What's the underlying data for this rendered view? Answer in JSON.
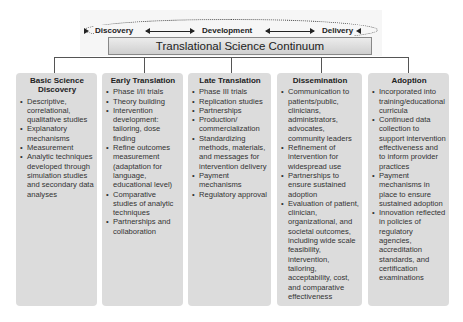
{
  "header": {
    "phases": [
      "Discovery",
      "Development",
      "Delivery"
    ],
    "continuum_label": "Translational Science Continuum"
  },
  "stages": [
    {
      "title": "Basic Science Discovery",
      "items": [
        "Descriptive, correlational, qualitative studies",
        "Explanatory mechanisms",
        "Measurement",
        "Analytic techniques developed through simulation studies and secondary data analyses"
      ]
    },
    {
      "title": "Early Translation",
      "items": [
        "Phase I/II trials",
        "Theory building",
        "Intervention development: tailoring, dose finding",
        "Refine outcomes measurement (adaptation for language, educational level)",
        "Comparative studies of analytic techniques",
        "Partnerships and collaboration"
      ]
    },
    {
      "title": "Late Translation",
      "items": [
        "Phase III trials",
        "Replication studies",
        "Partnerships",
        "Production/ commercialization",
        "Standardizing methods, materials, and messages for intervention delivery",
        "Payment mechanisms",
        "Regulatory approval"
      ]
    },
    {
      "title": "Dissemination",
      "items": [
        "Communication to patients/public, clinicians, administrators, advocates, community leaders",
        "Refinement of intervention for widespread use",
        "Partnerships to ensure sustained adoption",
        "Evaluation of patient, clinician, organizational, and societal outcomes, including wide scale feasibility, intervention, tailoring, acceptability, cost, and comparative effectiveness"
      ]
    },
    {
      "title": "Adoption",
      "items": [
        "Incorporated into training/educational curricula",
        "Continued data collection to support intervention effectiveness and to inform provider practices",
        "Payment mechanisms in place to ensure sustained adoption",
        "Innovation reflected in policies of regulatory agencies, accreditation standards, and certification examinations"
      ]
    }
  ]
}
